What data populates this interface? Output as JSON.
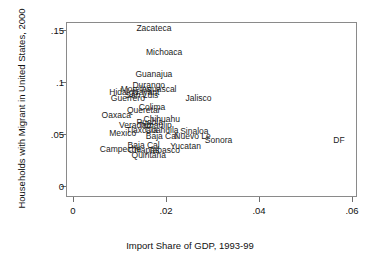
{
  "chart_data": {
    "type": "scatter",
    "title": "",
    "xlabel": "Import Share of GDP, 1993-99",
    "ylabel": "Households with Migrant in United States, 2000",
    "xlim": [
      0,
      0.06
    ],
    "ylim": [
      0,
      0.158
    ],
    "xticks": [
      "0",
      ".02",
      ".04",
      ".06"
    ],
    "xtick_values": [
      0,
      0.02,
      0.04,
      0.06
    ],
    "yticks": [
      "0",
      ".05",
      ".1",
      ".15"
    ],
    "ytick_values": [
      0,
      0.05,
      0.1,
      0.15
    ],
    "grid": false,
    "legend": null,
    "marker_style": "text-labels",
    "points": [
      {
        "label": "Zacateca",
        "x": 0.0174,
        "y": 0.1521
      },
      {
        "label": "Michoaca",
        "x": 0.0196,
        "y": 0.1285
      },
      {
        "label": "Guanajua",
        "x": 0.0174,
        "y": 0.1076
      },
      {
        "label": "Durango",
        "x": 0.0163,
        "y": 0.0973
      },
      {
        "label": "Morelos",
        "x": 0.0135,
        "y": 0.093
      },
      {
        "label": "Aguascal",
        "x": 0.0185,
        "y": 0.093
      },
      {
        "label": "Hidalgo",
        "x": 0.0109,
        "y": 0.0901
      },
      {
        "label": "Nayarit",
        "x": 0.0157,
        "y": 0.0901
      },
      {
        "label": "San Luis",
        "x": 0.0148,
        "y": 0.0873
      },
      {
        "label": "Guerrero",
        "x": 0.0118,
        "y": 0.0844
      },
      {
        "label": "Jalisco",
        "x": 0.027,
        "y": 0.0844
      },
      {
        "label": "Colima",
        "x": 0.017,
        "y": 0.0758
      },
      {
        "label": "Queretar",
        "x": 0.0152,
        "y": 0.0729
      },
      {
        "label": "Oaxaca",
        "x": 0.0093,
        "y": 0.0686
      },
      {
        "label": "Chihuahu",
        "x": 0.0191,
        "y": 0.0643
      },
      {
        "label": "Puebla",
        "x": 0.0165,
        "y": 0.0614
      },
      {
        "label": "Veracruz",
        "x": 0.0135,
        "y": 0.0585
      },
      {
        "label": "Tamaulip",
        "x": 0.0176,
        "y": 0.0585
      },
      {
        "label": "Sinaloa",
        "x": 0.0261,
        "y": 0.0528
      },
      {
        "label": "Tlaxcala",
        "x": 0.0148,
        "y": 0.0542
      },
      {
        "label": "Coahuila",
        "x": 0.0191,
        "y": 0.0542
      },
      {
        "label": "Mexico",
        "x": 0.0107,
        "y": 0.0514
      },
      {
        "label": "Baja Cal",
        "x": 0.0191,
        "y": 0.0485
      },
      {
        "label": "Nuevo Le",
        "x": 0.0257,
        "y": 0.0485
      },
      {
        "label": "Sonora",
        "x": 0.0313,
        "y": 0.0442
      },
      {
        "label": "Baja Cal",
        "x": 0.0152,
        "y": 0.0399
      },
      {
        "label": "Yucatan",
        "x": 0.0242,
        "y": 0.0385
      },
      {
        "label": "Campeche",
        "x": 0.0102,
        "y": 0.0356
      },
      {
        "label": "Chiapas",
        "x": 0.0152,
        "y": 0.0342
      },
      {
        "label": "Tabasco",
        "x": 0.0196,
        "y": 0.0342
      },
      {
        "label": "Quintana",
        "x": 0.0163,
        "y": 0.0299
      },
      {
        "label": "DF",
        "x": 0.0572,
        "y": 0.0442
      }
    ]
  }
}
